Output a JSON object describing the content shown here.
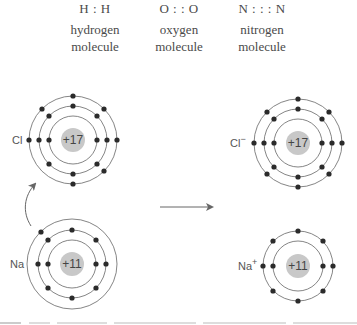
{
  "molecules": [
    {
      "formula": "H : H",
      "name_line1": "hydrogen",
      "name_line2": "molecule"
    },
    {
      "formula": "O : : O",
      "name_line1": "oxygen",
      "name_line2": "molecule"
    },
    {
      "formula": "N : : : N",
      "name_line1": "nitrogen",
      "name_line2": "molecule"
    }
  ],
  "atoms": {
    "chlorine": {
      "label": "Cl",
      "nucleus": "+17",
      "shells": [
        2,
        8,
        7
      ]
    },
    "sodium": {
      "label": "Na",
      "nucleus": "+11",
      "shells": [
        2,
        8,
        1
      ]
    },
    "chloride_ion": {
      "label": "Cl",
      "charge": "−",
      "nucleus": "+17",
      "shells": [
        2,
        8,
        8
      ]
    },
    "sodium_ion": {
      "label": "Na",
      "charge": "+",
      "nucleus": "+11",
      "shells": [
        2,
        8
      ]
    }
  },
  "arrows": {
    "electron_transfer": "curved arrow from Na outer electron to Cl",
    "reaction": "right arrow"
  },
  "colors": {
    "electron": "#2b2b2b",
    "orbit": "#666666",
    "nucleus": "#c8c8c8",
    "text": "#4a4a4a"
  }
}
